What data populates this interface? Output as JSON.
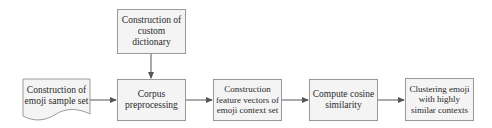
{
  "diagram": {
    "nodes": [
      {
        "id": "dict",
        "label": "Construction of custom dictionary",
        "shape": "rectangle"
      },
      {
        "id": "sample",
        "label": "Construction of emoji sample set",
        "shape": "document"
      },
      {
        "id": "corpus",
        "label": "Corpus preprocessing",
        "shape": "rectangle"
      },
      {
        "id": "features",
        "label": "Construction feature vectors of emoji context set",
        "shape": "rectangle"
      },
      {
        "id": "cosine",
        "label": "Compute cosine similarity",
        "shape": "rectangle"
      },
      {
        "id": "cluster",
        "label": "Clustering emoji with highly similar contexts",
        "shape": "rectangle"
      }
    ],
    "edges": [
      {
        "from": "dict",
        "to": "corpus"
      },
      {
        "from": "sample",
        "to": "corpus"
      },
      {
        "from": "corpus",
        "to": "features"
      },
      {
        "from": "features",
        "to": "cosine"
      },
      {
        "from": "cosine",
        "to": "cluster"
      }
    ],
    "colors": {
      "box_fill": "#f4f4f4",
      "box_border": "#9a9a9a",
      "arrow": "#555555"
    }
  }
}
